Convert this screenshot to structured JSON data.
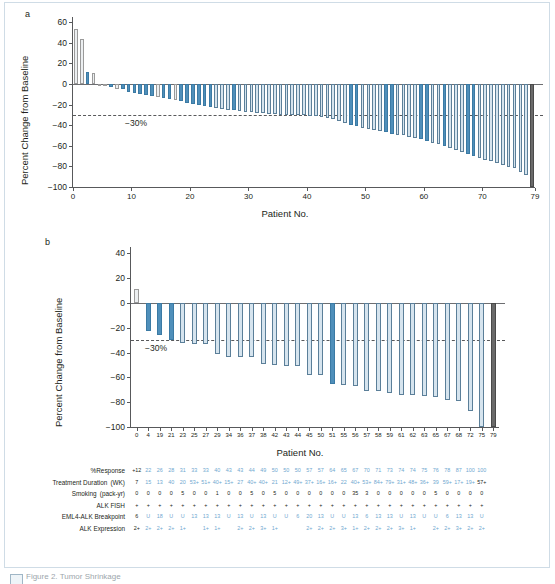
{
  "figure": {
    "panel_a_letter": "a",
    "panel_b_letter": "b",
    "ylabel": "Percent Change from Baseline",
    "xlabel": "Patient No.",
    "threshold_label": "−30%",
    "colors": {
      "bar_blue": "#4f8fba",
      "bar_light": "#d6e4ee",
      "bar_gray": "#d9d9d9",
      "bar_dark_gray": "#6a6a6a",
      "bar_outline": "#5b7f99",
      "axis": "#58595b",
      "text": "#231f20",
      "table_blue": "#6fa8d0",
      "card_border": "#cfdce6"
    }
  },
  "panel_a": {
    "letter": "a",
    "yticks": [
      "60",
      "40",
      "20",
      "0",
      "−20",
      "−40",
      "−60",
      "−80",
      "−100"
    ],
    "ytick_values": [
      60,
      40,
      20,
      0,
      -20,
      -40,
      -60,
      -80,
      -100
    ],
    "xticks": [
      "0",
      "10",
      "20",
      "30",
      "40",
      "50",
      "60",
      "70",
      "79"
    ],
    "xtick_values": [
      0,
      10,
      20,
      30,
      40,
      50,
      60,
      70,
      79
    ],
    "ylim": [
      -100,
      65
    ],
    "threshold": -30,
    "threshold_label": "−30%"
  },
  "panel_b": {
    "letter": "b",
    "yticks": [
      "40",
      "20",
      "0",
      "−20",
      "−40",
      "−60",
      "−80",
      "−100"
    ],
    "ytick_values": [
      40,
      20,
      0,
      -20,
      -40,
      -60,
      -80,
      -100
    ],
    "ylim": [
      -100,
      45
    ],
    "threshold": -30,
    "threshold_label": "−30%",
    "patient_numbers": [
      "0",
      "4",
      "19",
      "21",
      "23",
      "25",
      "27",
      "29",
      "34",
      "36",
      "37",
      "38",
      "42",
      "43",
      "44",
      "45",
      "50",
      "51",
      "55",
      "56",
      "57",
      "58",
      "59",
      "61",
      "62",
      "63",
      "65",
      "67",
      "68",
      "72",
      "75",
      "79"
    ]
  },
  "table": {
    "rows": [
      {
        "label": "%Response",
        "values": [
          "+12",
          "22",
          "26",
          "28",
          "31",
          "33",
          "33",
          "40",
          "43",
          "43",
          "44",
          "49",
          "50",
          "50",
          "50",
          "57",
          "57",
          "64",
          "65",
          "67",
          "70",
          "71",
          "73",
          "74",
          "74",
          "75",
          "76",
          "78",
          "87",
          "100",
          "100"
        ],
        "first_black": 1
      },
      {
        "label": "Treatment Duration (WK)",
        "values": [
          "7",
          "15",
          "13",
          "40",
          "20",
          "53+",
          "51+",
          "40+",
          "15+",
          "27",
          "40+",
          "40+",
          "21",
          "12+",
          "49+",
          "37+",
          "16+",
          "16+",
          "22",
          "40+",
          "53+",
          "84+",
          "79+",
          "31+",
          "48+",
          "36+",
          "39",
          "59+",
          "17+",
          "19+",
          "57+"
        ],
        "first_black": 1,
        "last_black": 1
      },
      {
        "label": "Smoking (pack-yr)",
        "values": [
          "0",
          "0",
          "0",
          "0",
          "5",
          "0",
          "0",
          "1",
          "0",
          "0",
          "5",
          "0",
          "5",
          "0",
          "0",
          "0",
          "0",
          "0",
          "0",
          "35",
          "3",
          "0",
          "0",
          "0",
          "0",
          "0",
          "5",
          "0",
          "0",
          "0",
          "0"
        ],
        "all_black": 1
      },
      {
        "label": "ALK FISH",
        "values": [
          "+",
          "+",
          "+",
          "+",
          "+",
          "+",
          "+",
          "+",
          "+",
          "+",
          "+",
          "+",
          "+",
          "+",
          "+",
          "+",
          "+",
          "+",
          "+",
          "+",
          "+",
          "+",
          "+",
          "+",
          "+",
          "+",
          "+",
          "+",
          "+",
          "+",
          "+"
        ],
        "all_black": 1
      },
      {
        "label": "EML4-ALK Breakpoint",
        "values": [
          "6",
          "U",
          "18",
          "U",
          "U",
          "13",
          "13",
          "13",
          "U",
          "13",
          "U",
          "13",
          "U",
          "U",
          "6",
          "20",
          "13",
          "U",
          "U",
          "13",
          "6",
          "13",
          "13",
          "U",
          "13",
          "U",
          "U",
          "6",
          "13",
          "13",
          "U"
        ],
        "first_black": 1
      },
      {
        "label": "ALK Expression",
        "values": [
          "2+",
          "2+",
          "2+",
          "2+",
          "1+",
          "",
          "1+",
          "1+",
          "",
          "2+",
          "2+",
          "3+",
          "1+",
          "",
          "",
          "2+",
          "2+",
          "2+",
          "3+",
          "1+",
          "2+",
          "2+",
          "2+",
          "3+",
          "1+",
          "",
          "2+",
          "2+",
          "3+",
          "2+",
          "2+"
        ],
        "first_black": 1
      }
    ]
  },
  "caption": {
    "text": "Figure 2. Tumor Shrinkage"
  },
  "chart_data": {
    "type": "bar",
    "xlabel": "Patient No.",
    "ylabel": "Percent Change from Baseline",
    "panels": [
      {
        "id": "a",
        "label": "a",
        "ylim": [
          -100,
          65
        ],
        "yticks": [
          60,
          40,
          20,
          0,
          -20,
          -40,
          -60,
          -80,
          -100
        ],
        "xticks": [
          0,
          10,
          20,
          30,
          40,
          50,
          60,
          70,
          79
        ],
        "grid": false,
        "reference_line": {
          "value": -30,
          "label": "−30%",
          "style": "dotted"
        },
        "n_bars": 79,
        "series": [
          {
            "name": "Best percent change from baseline",
            "values": [
              53,
              44,
              12,
              11,
              0,
              0,
              -3,
              -5,
              -5,
              -8,
              -9,
              -10,
              -11,
              -12,
              -13,
              -14,
              -15,
              -16,
              -17,
              -18,
              -19,
              -20,
              -21,
              -22,
              -23,
              -24,
              -25,
              -25,
              -26,
              -27,
              -27,
              -28,
              -28,
              -29,
              -29,
              -30,
              -30,
              -30,
              -30,
              -30,
              -31,
              -31,
              -32,
              -33,
              -34,
              -36,
              -38,
              -40,
              -41,
              -43,
              -44,
              -45,
              -46,
              -47,
              -49,
              -50,
              -50,
              -51,
              -52,
              -53,
              -55,
              -57,
              -58,
              -60,
              -62,
              -64,
              -66,
              -68,
              -70,
              -72,
              -74,
              -75,
              -77,
              -79,
              -81,
              -82,
              -85,
              -88,
              -100
            ],
            "colors": [
              "gray",
              "gray",
              "blue",
              "gray",
              "gray",
              "gray",
              "blue",
              "gray",
              "blue",
              "blue",
              "blue",
              "blue",
              "blue",
              "blue",
              "gray",
              "blue",
              "blue",
              "gray",
              "blue",
              "blue",
              "blue",
              "blue",
              "blue",
              "blue",
              "light",
              "light",
              "light",
              "blue",
              "light",
              "light",
              "light",
              "light",
              "light",
              "light",
              "light",
              "light",
              "light",
              "light",
              "light",
              "light",
              "light",
              "light",
              "light",
              "light",
              "light",
              "light",
              "light",
              "blue",
              "blue",
              "light",
              "light",
              "light",
              "light",
              "blue",
              "blue",
              "light",
              "light",
              "light",
              "light",
              "blue",
              "blue",
              "light",
              "light",
              "blue",
              "light",
              "light",
              "light",
              "blue",
              "blue",
              "light",
              "light",
              "light",
              "light",
              "light",
              "light",
              "light",
              "light",
              "light",
              "darkgray"
            ]
          }
        ]
      },
      {
        "id": "b",
        "label": "b",
        "ylim": [
          -100,
          45
        ],
        "yticks": [
          40,
          20,
          0,
          -20,
          -40,
          -60,
          -80,
          -100
        ],
        "grid": false,
        "reference_line": {
          "value": -30,
          "label": "−30%",
          "style": "dotted"
        },
        "categories": [
          "0",
          "4",
          "19",
          "21",
          "23",
          "25",
          "27",
          "29",
          "34",
          "36",
          "37",
          "38",
          "42",
          "43",
          "44",
          "45",
          "50",
          "51",
          "55",
          "56",
          "57",
          "58",
          "59",
          "61",
          "62",
          "63",
          "65",
          "67",
          "68",
          "72",
          "75",
          "79"
        ],
        "series": [
          {
            "name": "Best percent change from baseline",
            "values": [
              11,
              -23,
              -26,
              -30,
              -32,
              -33,
              -33,
              -41,
              -44,
              -44,
              -44,
              -49,
              -50,
              -51,
              -51,
              -58,
              -58,
              -65,
              -66,
              -67,
              -71,
              -71,
              -73,
              -74,
              -74,
              -75,
              -76,
              -78,
              -79,
              -87,
              -100,
              -100
            ],
            "colors": [
              "gray",
              "blue",
              "blue",
              "blue",
              "light",
              "light",
              "light",
              "light",
              "light",
              "light",
              "light",
              "light",
              "light",
              "light",
              "light",
              "light",
              "light",
              "blue",
              "light",
              "light",
              "light",
              "light",
              "light",
              "light",
              "light",
              "light",
              "light",
              "light",
              "light",
              "light",
              "light",
              "darkgray"
            ]
          }
        ]
      }
    ]
  }
}
